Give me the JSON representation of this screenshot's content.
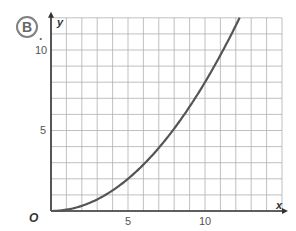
{
  "figure": {
    "badge_label": "B",
    "badge_suffix": "."
  },
  "chart_data": {
    "type": "line",
    "title": "",
    "badge": "B.",
    "xlabel": "x",
    "ylabel": "y",
    "origin_label": "O",
    "xlim": [
      0,
      15
    ],
    "ylim": [
      0,
      12
    ],
    "grid": true,
    "grid_step": 1,
    "x_ticks": [
      {
        "value": 5,
        "label": "5"
      },
      {
        "value": 10,
        "label": "10"
      }
    ],
    "y_ticks": [
      {
        "value": 5,
        "label": "5"
      },
      {
        "value": 10,
        "label": "10"
      }
    ],
    "series": [
      {
        "name": "curve",
        "equation": "y = 0.08 x^2",
        "color": "#555555",
        "x": [
          0,
          1,
          2,
          3,
          4,
          5,
          6,
          7,
          8,
          9,
          10,
          11,
          12,
          12.25
        ],
        "y": [
          0,
          0.08,
          0.32,
          0.72,
          1.28,
          2.0,
          2.88,
          3.92,
          5.12,
          6.48,
          8.0,
          9.68,
          11.52,
          12.0
        ]
      }
    ],
    "colors": {
      "grid": "#b0b0b0",
      "axis": "#333333",
      "curve": "#555555"
    }
  }
}
